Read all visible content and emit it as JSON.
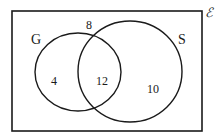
{
  "diagram": {
    "type": "venn",
    "universal_set": {
      "symbol": "ℰ"
    },
    "sets": [
      {
        "name": "G",
        "label": "G"
      },
      {
        "name": "S",
        "label": "S"
      }
    ],
    "regions": {
      "outside": "8",
      "g_only": "4",
      "g_and_s": "12",
      "s_only": "10"
    },
    "colors": {
      "stroke": "#1a1a1a",
      "background": "#ffffff"
    }
  }
}
